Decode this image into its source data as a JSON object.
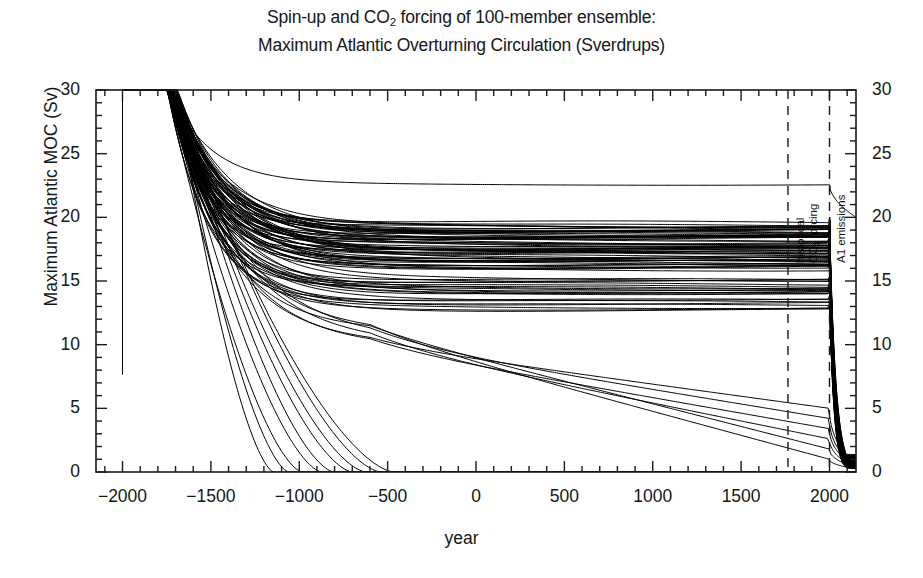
{
  "figure": {
    "width": 923,
    "height": 578,
    "background": "#ffffff",
    "line_color": "#000000",
    "axis_color": "#1a1a1a"
  },
  "title": {
    "line1_pre": "Spin-up and CO",
    "line1_sub": "2",
    "line1_post": " forcing of 100-member ensemble:",
    "line2": "Maximum Atlantic Overturning Circulation (Sverdrups)"
  },
  "axes": {
    "xlabel": "year",
    "ylabel": "Maximum Atlantic MOC (Sv)",
    "x_ticks": [
      "-2000",
      "-1500",
      "-1000",
      "-500",
      "0",
      "500",
      "1000",
      "1500",
      "2000"
    ],
    "y_ticks": [
      "0",
      "5",
      "10",
      "15",
      "20",
      "25",
      "30"
    ],
    "y_ticks_right": [
      "0",
      "5",
      "10",
      "15",
      "20",
      "25",
      "30"
    ]
  },
  "annotations": {
    "historical_line1": "historical",
    "historical_line2_pre": "CO",
    "historical_line2_sub": "2",
    "historical_line2_post": " forcing",
    "a1": "A1 emissions"
  },
  "chart_data": {
    "type": "line",
    "title": "Spin-up and CO2 forcing of 100-member ensemble: Maximum Atlantic Overturning Circulation (Sverdrups)",
    "xlabel": "year",
    "ylabel": "Maximum Atlantic MOC (Sv)",
    "xlim": [
      -2150,
      2150
    ],
    "ylim": [
      0,
      30
    ],
    "xticks": [
      -2000,
      -1500,
      -1000,
      -500,
      0,
      500,
      1000,
      1500,
      2000
    ],
    "yticks": [
      0,
      5,
      10,
      15,
      20,
      25,
      30
    ],
    "x_minor_tick_step": 100,
    "y_minor_tick_step": 1,
    "grid": false,
    "legend": "none",
    "n_members": 100,
    "series_color": "#000000",
    "series_width": 1.0,
    "vlines": [
      {
        "x": 1765,
        "label": "historical CO2 forcing",
        "style": "dashed"
      },
      {
        "x": 2000,
        "label": "A1 emissions",
        "style": "dashed"
      }
    ],
    "notes": [
      "All members initialised at 30 Sv at year -2000; a near-vertical segment at the left edge spans about 7 to 30 Sv.",
      "Spin-up decay begins around year -1700; bundle spreads and relaxes toward quasi-equilibrium by year -500.",
      "Main ensemble bundle plateaus between about 16.0 and 19.5 Sv.",
      "A secondary band plateaus near 14.0 to 15.0 Sv, another near 12.8 to 13.5 Sv.",
      "One isolated member plateaus near 22.6 Sv.",
      "A handful of members collapse to 0 Sv between year -1150 and -450.",
      "A few slowly declining members drop from about 10 Sv to 4-5 Sv and 1-2 Sv by year 2000.",
      "After the A1 emissions line at year 2000, nearly all members collapse steeply toward 0 Sv by year 2100."
    ],
    "plateau_groups": [
      {
        "name": "isolated-high",
        "count": 1,
        "level": 22.6
      },
      {
        "name": "main-bundle",
        "count": 62,
        "level_min": 16.0,
        "level_max": 19.5
      },
      {
        "name": "mid-band",
        "count": 14,
        "level_min": 14.0,
        "level_max": 15.1
      },
      {
        "name": "low-band",
        "count": 8,
        "level_min": 12.7,
        "level_max": 13.6
      },
      {
        "name": "slow-decline",
        "count": 6,
        "start": 10.5,
        "end_min": 1.0,
        "end_max": 5.0
      },
      {
        "name": "collapsed",
        "count": 9,
        "level": 0.0,
        "collapse_year_min": -1150,
        "collapse_year_max": -450
      }
    ],
    "series": [
      {
        "name": "ensemble member (representative)",
        "x": [
          -2000,
          -1700,
          -1400,
          -1100,
          -800,
          -500,
          0,
          500,
          1000,
          1500,
          1765,
          2000,
          2050,
          2100,
          2150
        ],
        "y": [
          30,
          30,
          24.5,
          20.8,
          19.4,
          19.0,
          18.9,
          18.9,
          18.9,
          18.9,
          18.9,
          19.4,
          12.0,
          3.0,
          0.6
        ]
      },
      {
        "name": "isolated high member",
        "x": [
          -2000,
          -1700,
          -1400,
          -1100,
          -800,
          -500,
          0,
          500,
          1000,
          1500,
          1765,
          2000,
          2050,
          2100,
          2150
        ],
        "y": [
          30,
          30,
          26.5,
          24.0,
          23.2,
          22.9,
          22.8,
          22.7,
          22.7,
          22.7,
          22.7,
          22.7,
          20.5,
          20.1,
          20.0
        ]
      },
      {
        "name": "mid band member",
        "x": [
          -2000,
          -1700,
          -1400,
          -1100,
          -800,
          -500,
          0,
          500,
          1000,
          1500,
          1765,
          2000,
          2050,
          2100,
          2150
        ],
        "y": [
          30,
          30,
          22.0,
          17.0,
          15.3,
          14.8,
          14.6,
          14.5,
          14.5,
          14.5,
          14.5,
          14.8,
          8.0,
          1.8,
          0.4
        ]
      },
      {
        "name": "slow decline member",
        "x": [
          -2000,
          -1700,
          -1400,
          -1100,
          -800,
          -500,
          0,
          500,
          1000,
          1500,
          1765,
          2000,
          2050,
          2100,
          2150
        ],
        "y": [
          30,
          30,
          19.0,
          12.5,
          10.6,
          10.2,
          9.3,
          8.2,
          7.0,
          5.8,
          5.2,
          4.6,
          1.2,
          0.2,
          0.1
        ]
      },
      {
        "name": "collapsed member",
        "x": [
          -2000,
          -1700,
          -1400,
          -1200,
          -1100,
          -1000,
          -900,
          -800,
          0,
          1000,
          2000,
          2150
        ],
        "y": [
          30,
          30,
          17.0,
          10.0,
          6.0,
          2.5,
          0.6,
          0.0,
          0.0,
          0.0,
          0.0,
          0.0
        ]
      }
    ]
  }
}
